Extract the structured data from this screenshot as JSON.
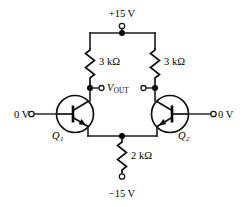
{
  "diagram": {
    "background_color": "#ffffff",
    "line_color": "#111111"
  },
  "supplies": {
    "positive": "+15 V",
    "negative": "−15 V"
  },
  "inputs": {
    "left": "0 V",
    "right": "0 V"
  },
  "output": {
    "label": "V",
    "subscript": "OUT"
  },
  "resistors": [
    {
      "name": "left-collector-resistor",
      "value": "3 kΩ"
    },
    {
      "name": "right-collector-resistor",
      "value": "3 kΩ"
    },
    {
      "name": "tail-resistor",
      "value": "2 kΩ"
    }
  ],
  "transistors": [
    {
      "name": "transistor-q1",
      "label": "Q",
      "subscript": "1",
      "type": "npn"
    },
    {
      "name": "transistor-q2",
      "label": "Q",
      "subscript": "2",
      "type": "npn"
    }
  ]
}
